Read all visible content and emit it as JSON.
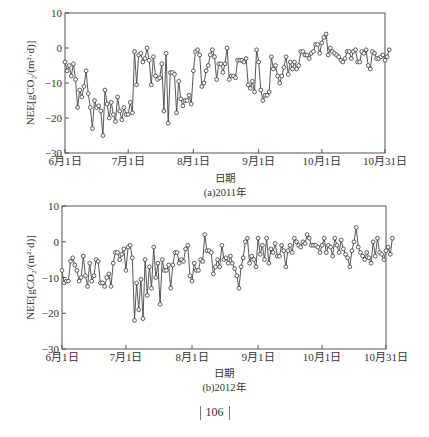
{
  "chart_data": [
    {
      "type": "line",
      "title": "",
      "caption": "(a)2011年",
      "xlabel": "日期",
      "ylabel": "NEE[gCO₂/(m²·d)]",
      "ylim": [
        -30,
        10
      ],
      "yticks": [
        -30,
        -20,
        -10,
        0,
        10
      ],
      "xticks": [
        "6月1日",
        "7月1日",
        "8月1日",
        "9月1日",
        "10月1日",
        "10月31日"
      ],
      "xrange": [
        "6月1日",
        "10月31日"
      ],
      "grid": false,
      "legend": null,
      "marker": "open-circle",
      "series": [
        {
          "name": "NEE 2011",
          "values": [
            -4,
            -6.5,
            -5,
            -8,
            -4.5,
            -9,
            -17,
            -12,
            -14,
            -11,
            -6.5,
            -13,
            -17,
            -23,
            -15,
            -17,
            -16.5,
            -18,
            -25,
            -12,
            -16,
            -20,
            -15.5,
            -19,
            -21,
            -14,
            -18,
            -20.5,
            -17,
            -19,
            -19,
            -15.5,
            -18.5,
            -1,
            -10.5,
            -2,
            -1.5,
            -4,
            -3,
            0,
            -3.5,
            -10.5,
            -2.5,
            -8,
            -9,
            -8.5,
            -4.5,
            -18,
            -1.5,
            -21.5,
            -7,
            -7,
            -7.5,
            -18.5,
            -9.5,
            -14.5,
            -16.5,
            -15,
            -15,
            -13.5,
            -16,
            -6.5,
            -1,
            -0.5,
            -2,
            -11,
            -10,
            -6.5,
            -5,
            -2,
            -0.5,
            -2.5,
            -9,
            -4.5,
            -4.5,
            -7,
            -4.5,
            0,
            -9,
            -8,
            -8,
            -8.5,
            -3.5,
            -3.5,
            -3.5,
            -4,
            -3,
            -10.5,
            -11.5,
            -9.5,
            -12.5,
            -0.5,
            -4,
            -12,
            -15,
            -13.5,
            -13.5,
            -12.5,
            -2.5,
            -6,
            -5,
            -8,
            -10,
            -8,
            -5.5,
            -2.5,
            -7.5,
            -4,
            -6,
            -4,
            -6,
            -5,
            -1,
            -1,
            -2,
            -2,
            -3,
            -1.5,
            -1,
            1,
            1,
            -1.5,
            1.5,
            3,
            4,
            -2,
            0,
            -1,
            -1.5,
            -2,
            -2.5,
            -3.5,
            -4,
            -3,
            -1,
            -1,
            -3,
            -1,
            -0.5,
            -4,
            -4,
            -1,
            -1.5,
            -0.5,
            -5,
            -6,
            -1,
            -1.5,
            -3,
            -3,
            -2.5,
            -2,
            -3.5,
            -2.5,
            -0.5
          ]
        }
      ]
    },
    {
      "type": "line",
      "title": "",
      "caption": "(b)2012年",
      "xlabel": "日期",
      "ylabel": "NEE[gCO₂/(m²·d)]",
      "ylim": [
        -30,
        10
      ],
      "yticks": [
        -30,
        -20,
        -10,
        0,
        10
      ],
      "xticks": [
        "6月1日",
        "7月1日",
        "8月1日",
        "9月1日",
        "10月1日",
        "10月31日"
      ],
      "xrange": [
        "6月1日",
        "10月31日"
      ],
      "grid": false,
      "legend": null,
      "marker": "open-circle",
      "series": [
        {
          "name": "NEE 2012",
          "values": [
            -8,
            -11.5,
            -11,
            -11,
            -5.5,
            -4.5,
            -6.5,
            -8,
            -11,
            -10,
            -4,
            -9.5,
            -12.5,
            -6,
            -11,
            -9.5,
            -5,
            -5.5,
            -11.5,
            -11.5,
            -12.5,
            -10,
            -9,
            -12.5,
            -6,
            -3,
            -3,
            -5,
            -3.5,
            -2,
            -8,
            -1.5,
            -1,
            -4.5,
            -22,
            -11.5,
            -19,
            -10.5,
            -21.5,
            -5,
            -15,
            -7,
            -13,
            -1.5,
            -10,
            -6,
            -17.5,
            -5,
            -8,
            -8,
            -6.5,
            -13,
            -6.5,
            -3,
            -3,
            -6,
            -5,
            -5.5,
            -2,
            -1,
            -9.5,
            -11,
            -6,
            -8,
            -8,
            -5,
            -5.5,
            2,
            -2.5,
            -2.5,
            -3,
            -9,
            -7,
            -5,
            -7,
            -1,
            -5,
            -4.5,
            -6,
            -4,
            -6,
            -7.5,
            -9.5,
            -13,
            -7,
            -4.5,
            0,
            1,
            -6,
            -4,
            -5,
            -7,
            1,
            -3.5,
            -1,
            -5,
            1,
            -6,
            -2,
            -3,
            -0.5,
            -4,
            -4,
            -1,
            -2.5,
            -7,
            -2.5,
            -1,
            -3,
            1,
            0,
            -1,
            -1.5,
            0,
            -0.5,
            2,
            1,
            -1,
            -1,
            -1,
            -1.5,
            -3,
            -1,
            1,
            -3,
            -1,
            -1.5,
            -4,
            1,
            -1,
            -3,
            0.5,
            -2,
            -3.5,
            -4.5,
            -7,
            -2.5,
            0,
            4,
            -1.5,
            -3,
            -4,
            -5,
            -3,
            -4.5,
            -6,
            0,
            -4,
            1,
            -3,
            -3.5,
            -5,
            -2.5,
            -1.5,
            -3.5,
            1
          ]
        }
      ]
    }
  ],
  "charts": [
    {
      "ylabel": "NEE[gCO₂/(m²·d)]",
      "xlabel": "日期",
      "caption": "(a)2011年"
    },
    {
      "ylabel": "NEE[gCO₂/(m²·d)]",
      "xlabel": "日期",
      "caption": "(b)2012年"
    }
  ],
  "page": {
    "number": "106"
  }
}
